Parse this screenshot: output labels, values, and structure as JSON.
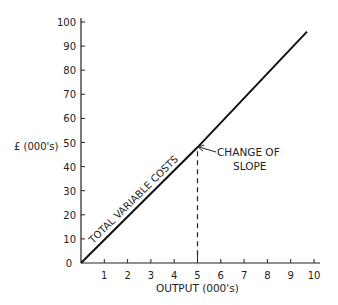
{
  "chart_data": {
    "type": "line",
    "title": "",
    "xlabel": "OUTPUT (000's)",
    "ylabel": "£ (000's)",
    "xlim": [
      0,
      10
    ],
    "ylim": [
      0,
      100
    ],
    "x_ticks": [
      "1",
      "2",
      "3",
      "4",
      "5",
      "6",
      "7",
      "8",
      "9",
      "10"
    ],
    "y_ticks": [
      "0",
      "10",
      "20",
      "30",
      "40",
      "50",
      "60",
      "70",
      "80",
      "90",
      "100"
    ],
    "grid": false,
    "legend": null,
    "series": [
      {
        "name": "TOTAL VARIABLE COSTS",
        "x": [
          0,
          5,
          9.7
        ],
        "y": [
          0,
          48,
          96
        ]
      }
    ],
    "annotations": [
      {
        "text_line1": "CHANGE OF",
        "text_line2": "SLOPE",
        "x": 5,
        "y": 48
      }
    ]
  },
  "labels": {
    "series_label": "TOTAL VARIABLE COSTS",
    "annotation_line1": "CHANGE OF",
    "annotation_line2": "SLOPE",
    "xlabel": "OUTPUT (000's)",
    "ylabel": "£ (000's)",
    "origin": "0"
  }
}
